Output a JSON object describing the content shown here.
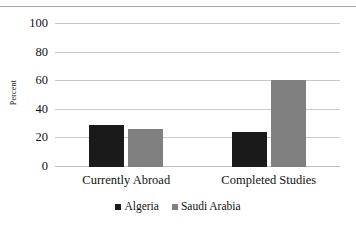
{
  "chart_data": {
    "type": "bar",
    "title": "",
    "xlabel": "",
    "ylabel": "Percent",
    "ylim": [
      0,
      100
    ],
    "yticks": [
      0,
      20,
      40,
      60,
      80,
      100
    ],
    "ytick_labels": [
      "0",
      "20",
      "40",
      "60",
      "80",
      "100"
    ],
    "grid": true,
    "legend_position": "bottom",
    "categories": [
      "Currently Abroad",
      "Completed Studies"
    ],
    "series": [
      {
        "name": "Algeria",
        "color": "#1a1a1a",
        "values": [
          29.5,
          24.5
        ]
      },
      {
        "name": "Saudi Arabia",
        "color": "#808080",
        "values": [
          26.5,
          61
        ]
      }
    ]
  },
  "colors": {
    "algeria": "#1a1a1a",
    "saudi_arabia": "#808080",
    "gridline": "#c9c9c9",
    "frame": "#a6a6a6",
    "background": "#ffffff",
    "text": "#111111"
  }
}
